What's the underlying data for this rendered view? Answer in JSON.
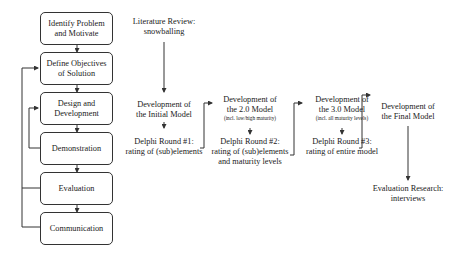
{
  "dsrm_steps": [
    {
      "line1": "Identify Problem",
      "line2": "and Motivate"
    },
    {
      "line1": "Define Objectives",
      "line2": "of Solution"
    },
    {
      "line1": "Design and",
      "line2": "Development"
    },
    {
      "line1": "Demonstration",
      "line2": ""
    },
    {
      "line1": "Evaluation",
      "line2": ""
    },
    {
      "line1": "Communication",
      "line2": ""
    }
  ],
  "research_flow": {
    "literature": {
      "line1": "Literature Review:",
      "line2": "snowballing"
    },
    "initial": {
      "line1": "Development of",
      "line2": "the Initial Model"
    },
    "delphi1": {
      "line1": "Delphi Round #1:",
      "line2": "rating of (sub)elements"
    },
    "model2": {
      "line1": "Development of",
      "line2": "the 2.0 Model",
      "note": "(incl. low/high maturity)"
    },
    "delphi2": {
      "line1": "Delphi Round #2:",
      "line2": "rating of (sub)elements",
      "line3": "and maturity levels"
    },
    "model3": {
      "line1": "Development of",
      "line2": "the 3.0 Model",
      "note": "(incl. all maturity levels)"
    },
    "delphi3": {
      "line1": "Delphi Round #3:",
      "line2": "rating of entire model"
    },
    "final": {
      "line1": "Development of",
      "line2": "the Final Model"
    },
    "evaluation": {
      "line1": "Evaluation Research:",
      "line2": "interviews"
    }
  }
}
